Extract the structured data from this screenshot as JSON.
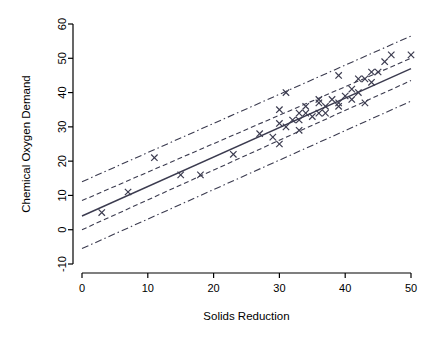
{
  "chart_data": {
    "type": "scatter",
    "title": "",
    "xlabel": "Solids Reduction",
    "ylabel": "Chemical Oxygen Demand",
    "xlim": [
      0,
      50
    ],
    "ylim": [
      -10,
      60
    ],
    "xticks": [
      0,
      10,
      20,
      30,
      40,
      50
    ],
    "yticks": [
      -10,
      0,
      10,
      20,
      30,
      40,
      50,
      60
    ],
    "xtick_labels": [
      "0",
      "10",
      "20",
      "30",
      "40",
      "50"
    ],
    "ytick_labels": [
      "-10",
      "0",
      "10",
      "20",
      "30",
      "40",
      "50",
      "60"
    ],
    "grid": false,
    "legend": "none",
    "point_marker": "x",
    "point_color": "#3b3b4f",
    "line_color": "#3b3b4f",
    "points": [
      {
        "x": 3,
        "y": 5
      },
      {
        "x": 7,
        "y": 11
      },
      {
        "x": 11,
        "y": 21
      },
      {
        "x": 15,
        "y": 16
      },
      {
        "x": 18,
        "y": 16
      },
      {
        "x": 27,
        "y": 28
      },
      {
        "x": 29,
        "y": 27
      },
      {
        "x": 30,
        "y": 25
      },
      {
        "x": 30,
        "y": 35
      },
      {
        "x": 31,
        "y": 30
      },
      {
        "x": 31,
        "y": 40
      },
      {
        "x": 32,
        "y": 32
      },
      {
        "x": 33,
        "y": 34
      },
      {
        "x": 33,
        "y": 32
      },
      {
        "x": 34,
        "y": 34
      },
      {
        "x": 36,
        "y": 37
      },
      {
        "x": 36,
        "y": 38
      },
      {
        "x": 36,
        "y": 34
      },
      {
        "x": 37,
        "y": 36
      },
      {
        "x": 38,
        "y": 38
      },
      {
        "x": 39,
        "y": 37
      },
      {
        "x": 39,
        "y": 36
      },
      {
        "x": 39,
        "y": 45
      },
      {
        "x": 40,
        "y": 39
      },
      {
        "x": 41,
        "y": 41
      },
      {
        "x": 42,
        "y": 40
      },
      {
        "x": 42,
        "y": 44
      },
      {
        "x": 43,
        "y": 37
      },
      {
        "x": 43,
        "y": 44
      },
      {
        "x": 44,
        "y": 46
      },
      {
        "x": 45,
        "y": 46
      },
      {
        "x": 46,
        "y": 49
      },
      {
        "x": 47,
        "y": 51
      },
      {
        "x": 50,
        "y": 51
      },
      {
        "x": 23,
        "y": 22
      },
      {
        "x": 34,
        "y": 36
      },
      {
        "x": 35,
        "y": 33
      },
      {
        "x": 37,
        "y": 34
      },
      {
        "x": 41,
        "y": 38
      },
      {
        "x": 44,
        "y": 43
      },
      {
        "x": 33,
        "y": 29
      },
      {
        "x": 30,
        "y": 31
      }
    ],
    "fit_line": {
      "style": "solid",
      "label": "regression-line",
      "x0": 0,
      "y0": 4.0,
      "x1": 50,
      "y1": 47.0
    },
    "confidence_band": {
      "style": "dashed",
      "label": "confidence-band",
      "upper": {
        "x0": 0,
        "y0": 8.5,
        "x1": 50,
        "y1": 50.0
      },
      "lower": {
        "x0": 0,
        "y0": 0.0,
        "x1": 50,
        "y1": 43.5
      }
    },
    "prediction_band": {
      "style": "dash-dot",
      "label": "prediction-band",
      "upper": {
        "x0": 0,
        "y0": 14.0,
        "x1": 50,
        "y1": 56.5
      },
      "lower": {
        "x0": 0,
        "y0": -5.5,
        "x1": 50,
        "y1": 37.5
      }
    }
  }
}
